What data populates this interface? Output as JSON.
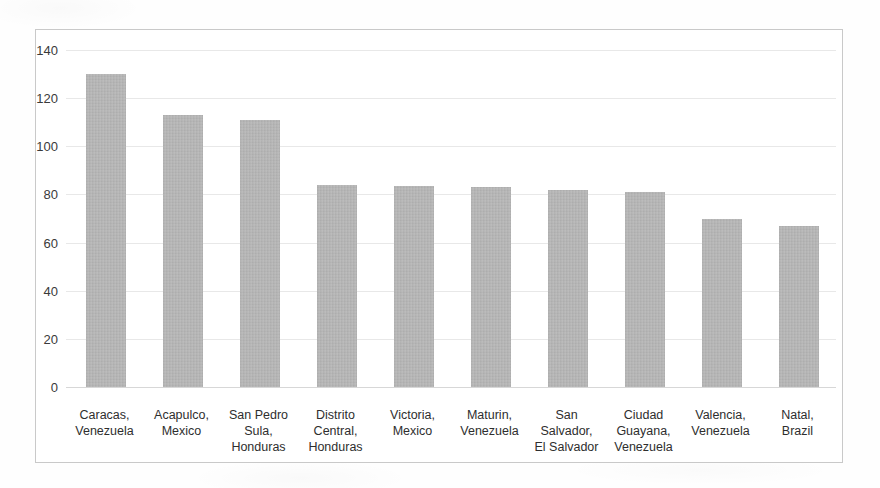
{
  "chart_data": {
    "type": "bar",
    "title": "",
    "subtitle": "",
    "xlabel": "",
    "ylabel": "",
    "ylim": [
      0,
      140
    ],
    "ytick_step": 20,
    "yticks": [
      140,
      120,
      100,
      80,
      60,
      40,
      20,
      0
    ],
    "grid": true,
    "legend": "none",
    "bar_color": "#b2b2b2",
    "categories": [
      "Caracas, Venezuela",
      "Acapulco, Mexico",
      "San Pedro Sula, Honduras",
      "Distrito Central, Honduras",
      "Victoria, Mexico",
      "Maturin, Venezuela",
      "San Salvador, El Salvador",
      "Ciudad Guayana, Venezuela",
      "Valencia, Venezuela",
      "Natal, Brazil"
    ],
    "category_lines": [
      [
        "Caracas,",
        "Venezuela"
      ],
      [
        "Acapulco,",
        "Mexico"
      ],
      [
        "San Pedro",
        "Sula,",
        "Honduras"
      ],
      [
        "Distrito",
        "Central,",
        "Honduras"
      ],
      [
        "Victoria,",
        "Mexico"
      ],
      [
        "Maturin,",
        "Venezuela"
      ],
      [
        "San",
        "Salvador,",
        "El Salvador"
      ],
      [
        "Ciudad",
        "Guayana,",
        "Venezuela"
      ],
      [
        "Valencia,",
        "Venezuela"
      ],
      [
        "Natal,",
        "Brazil"
      ]
    ],
    "values": [
      130,
      113,
      111,
      84,
      83.5,
      83,
      82,
      81,
      70,
      67
    ]
  }
}
